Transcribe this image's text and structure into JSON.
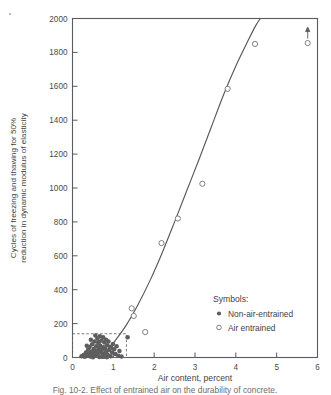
{
  "figure": {
    "caption": "Fig. 10-2. Effect of entrained air on the durability of concrete."
  },
  "chart_data": {
    "type": "scatter",
    "title": "",
    "xlabel": "Air content, percent",
    "ylabel": "Cycles of freezing and thawing for 50% reduction in dynamic modulus of elasticity",
    "ylabel_line1": "Cycles of freezing and thawing for 50%",
    "ylabel_line2": "reduction in dynamic modulus of elasticity",
    "xlim": [
      0,
      6
    ],
    "ylim": [
      0,
      2000
    ],
    "xticks": [
      0,
      1,
      2,
      3,
      4,
      5,
      6
    ],
    "yticks": [
      0,
      200,
      400,
      600,
      800,
      1000,
      1200,
      1400,
      1600,
      1800,
      2000
    ],
    "grid": false,
    "legend_position": "inside-lower-right",
    "series": [
      {
        "name": "Non-air-entrained",
        "marker": "filled-circle",
        "color": "#5e5e5e",
        "points": [
          [
            0.22,
            8
          ],
          [
            0.27,
            15
          ],
          [
            0.3,
            4
          ],
          [
            0.33,
            30
          ],
          [
            0.36,
            12
          ],
          [
            0.38,
            45
          ],
          [
            0.4,
            22
          ],
          [
            0.42,
            62
          ],
          [
            0.44,
            6
          ],
          [
            0.46,
            35
          ],
          [
            0.48,
            78
          ],
          [
            0.5,
            18
          ],
          [
            0.52,
            50
          ],
          [
            0.54,
            95
          ],
          [
            0.55,
            28
          ],
          [
            0.57,
            10
          ],
          [
            0.58,
            66
          ],
          [
            0.6,
            40
          ],
          [
            0.61,
            112
          ],
          [
            0.62,
            20
          ],
          [
            0.64,
            85
          ],
          [
            0.65,
            55
          ],
          [
            0.66,
            3
          ],
          [
            0.68,
            70
          ],
          [
            0.7,
            30
          ],
          [
            0.71,
            100
          ],
          [
            0.72,
            46
          ],
          [
            0.74,
            14
          ],
          [
            0.75,
            120
          ],
          [
            0.76,
            60
          ],
          [
            0.78,
            88
          ],
          [
            0.79,
            25
          ],
          [
            0.8,
            52
          ],
          [
            0.82,
            105
          ],
          [
            0.83,
            36
          ],
          [
            0.85,
            72
          ],
          [
            0.86,
            16
          ],
          [
            0.88,
            94
          ],
          [
            0.9,
            44
          ],
          [
            0.92,
            64
          ],
          [
            0.93,
            8
          ],
          [
            0.95,
            58
          ],
          [
            0.97,
            30
          ],
          [
            0.99,
            80
          ],
          [
            1.02,
            48
          ],
          [
            1.05,
            20
          ],
          [
            1.08,
            66
          ],
          [
            1.12,
            10
          ],
          [
            1.15,
            38
          ],
          [
            1.2,
            6
          ],
          [
            0.35,
            70
          ],
          [
            0.45,
            105
          ],
          [
            0.56,
            130
          ],
          [
            0.67,
            125
          ],
          [
            0.73,
            5
          ],
          [
            0.84,
            2
          ],
          [
            0.5,
            2
          ],
          [
            0.63,
            90
          ],
          [
            0.69,
            42
          ],
          [
            0.77,
            5
          ],
          [
            1.35,
            120
          ]
        ]
      },
      {
        "name": "Air entrained",
        "marker": "open-circle",
        "color": "#6a6a6a",
        "points": [
          [
            1.45,
            290
          ],
          [
            1.5,
            245
          ],
          [
            1.78,
            150
          ],
          [
            2.18,
            675
          ],
          [
            2.58,
            820
          ],
          [
            3.18,
            1025
          ],
          [
            3.8,
            1585
          ],
          [
            4.47,
            1850
          ],
          [
            5.76,
            1855
          ]
        ]
      }
    ],
    "annotations": [
      {
        "type": "up-arrow",
        "x": 5.76,
        "y": 1855,
        "note": "value exceeds plotted point"
      },
      {
        "type": "dashed-box",
        "x0": 0.0,
        "y0": 0,
        "x1": 1.32,
        "y1": 140,
        "note": "non-air-entrained data envelope"
      }
    ],
    "fit_curve": {
      "name": "fitted trend",
      "color": "#55595c",
      "points": [
        [
          0.72,
          0
        ],
        [
          1.0,
          85
        ],
        [
          1.3,
          185
        ],
        [
          1.6,
          310
        ],
        [
          1.9,
          455
        ],
        [
          2.2,
          620
        ],
        [
          2.5,
          800
        ],
        [
          2.8,
          985
        ],
        [
          3.1,
          1170
        ],
        [
          3.4,
          1360
        ],
        [
          3.7,
          1550
        ],
        [
          4.0,
          1720
        ],
        [
          4.3,
          1870
        ],
        [
          4.48,
          1955
        ],
        [
          4.6,
          2000
        ]
      ]
    },
    "legend": {
      "title": "Symbols:",
      "entries": [
        {
          "marker": "filled-circle",
          "label": "Non-air-entrained"
        },
        {
          "marker": "open-circle",
          "label": "Air entrained"
        }
      ]
    }
  }
}
